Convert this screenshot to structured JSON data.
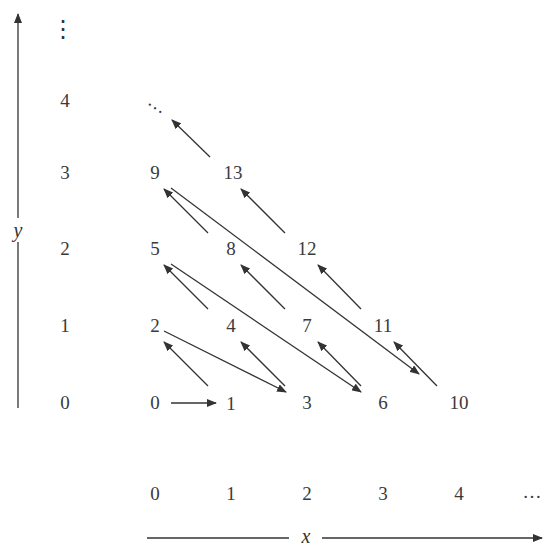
{
  "diagram": {
    "x_axis": {
      "label": "x",
      "ticks": [
        "0",
        "1",
        "2",
        "3",
        "4",
        "…"
      ]
    },
    "y_axis": {
      "label": "y",
      "ticks": [
        "0",
        "1",
        "2",
        "3",
        "4",
        "⋮"
      ]
    },
    "grid_cells": [
      {
        "x": 0,
        "y": 0,
        "value": "0"
      },
      {
        "x": 1,
        "y": 0,
        "value": "1"
      },
      {
        "x": 0,
        "y": 1,
        "value": "2"
      },
      {
        "x": 2,
        "y": 0,
        "value": "3"
      },
      {
        "x": 1,
        "y": 1,
        "value": "4"
      },
      {
        "x": 0,
        "y": 2,
        "value": "5"
      },
      {
        "x": 3,
        "y": 0,
        "value": "6"
      },
      {
        "x": 2,
        "y": 1,
        "value": "7"
      },
      {
        "x": 1,
        "y": 2,
        "value": "8"
      },
      {
        "x": 0,
        "y": 3,
        "value": "9"
      },
      {
        "x": 4,
        "y": 0,
        "value": "10"
      },
      {
        "x": 3,
        "y": 1,
        "value": "11"
      },
      {
        "x": 2,
        "y": 2,
        "value": "12"
      },
      {
        "x": 1,
        "y": 3,
        "value": "13"
      }
    ],
    "continuation": "…",
    "arrows": [
      {
        "from": "0",
        "to": "1"
      },
      {
        "from": "1",
        "to": "2"
      },
      {
        "from": "2",
        "to": "3"
      },
      {
        "from": "3",
        "to": "4"
      },
      {
        "from": "4",
        "to": "5"
      },
      {
        "from": "5",
        "to": "6"
      },
      {
        "from": "6",
        "to": "7"
      },
      {
        "from": "7",
        "to": "8"
      },
      {
        "from": "8",
        "to": "9"
      },
      {
        "from": "9",
        "to": "10"
      },
      {
        "from": "10",
        "to": "11"
      },
      {
        "from": "11",
        "to": "12"
      },
      {
        "from": "12",
        "to": "13"
      },
      {
        "from": "13",
        "to": "…"
      }
    ],
    "colors": {
      "ink": "#333333",
      "background": "#ffffff"
    }
  }
}
